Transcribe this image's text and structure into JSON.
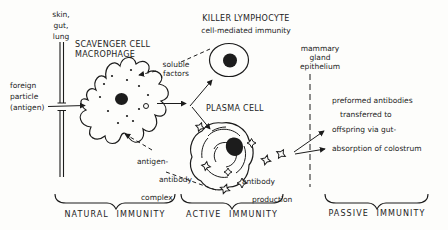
{
  "diagram": {
    "background": "#fdfdfb",
    "ink": "#1c1c1c",
    "labels": {
      "barrier": "skin,\ngut,\nlung",
      "foreign_particle": "foreign\nparticle\n(antigen)",
      "scavenger": "SCAVENGER CELL\nMACROPHAGE",
      "soluble_factors": "soluble\nfactors",
      "killer_lymphocyte": "KILLER LYMPHOCYTE",
      "cell_mediated": "cell-mediated immunity",
      "plasma_cell": "PLASMA CELL",
      "antigen_antibody_complex": {
        "lines": [
          "antigen-",
          "antibody",
          "complex"
        ]
      },
      "antibody_production": {
        "lines": [
          "antibody",
          "production"
        ]
      },
      "mammary": "mammary\ngland\nepithelium",
      "passive_notes": {
        "lines": [
          "preformed antibodies",
          "transferred to",
          "offspring via gut-",
          "absorption of colostrum"
        ]
      }
    },
    "sections": [
      {
        "label": "NATURAL IMMUNITY"
      },
      {
        "label": "ACTIVE IMMUNITY"
      },
      {
        "label": "PASSIVE IMMUNITY"
      }
    ],
    "icons": {
      "antibody_symbol": "four-point-star"
    }
  }
}
